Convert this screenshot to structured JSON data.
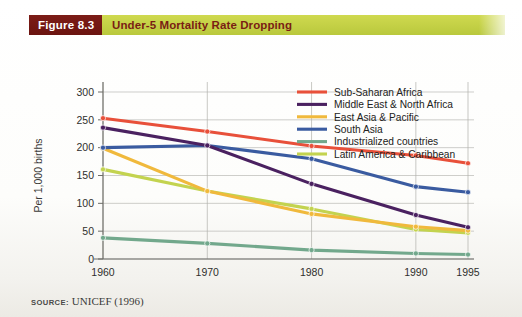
{
  "figure": {
    "tag": "Figure 8.3",
    "title": "Under-5 Mortality Rate Dropping",
    "tag_bg": "#6b1410",
    "bar_bg": "#c3d045",
    "title_color": "#7a1d14"
  },
  "source": {
    "label": "SOURCE:",
    "value": "UNICEF (1996)"
  },
  "chart_data": {
    "type": "line",
    "title": "Under-5 Mortality Rate Dropping",
    "xlabel": "",
    "ylabel": "Per 1,000 births",
    "x": [
      1960,
      1970,
      1980,
      1990,
      1995
    ],
    "xtick_labels": [
      "1960",
      "1970",
      "1980",
      "1990",
      "1995"
    ],
    "ytick_labels": [
      "0",
      "50",
      "100",
      "150",
      "200",
      "250",
      "300"
    ],
    "yticks": [
      0,
      50,
      100,
      150,
      200,
      250,
      300
    ],
    "ylim": [
      0,
      310
    ],
    "grid": true,
    "legend_position": "top-right",
    "series": [
      {
        "name": "Sub-Saharan Africa",
        "color": "#e8503a",
        "values": [
          253,
          229,
          203,
          186,
          172
        ]
      },
      {
        "name": "Middle East & North Africa",
        "color": "#4a2160",
        "values": [
          236,
          204,
          135,
          79,
          57
        ]
      },
      {
        "name": "East Asia & Pacific",
        "color": "#f0b93c",
        "values": [
          199,
          122,
          81,
          58,
          51
        ]
      },
      {
        "name": "South Asia",
        "color": "#3a5ba0",
        "values": [
          200,
          204,
          180,
          130,
          120
        ]
      },
      {
        "name": "Industrialized countries",
        "color": "#72a88c",
        "values": [
          38,
          28,
          16,
          10,
          8
        ]
      },
      {
        "name": "Latin America & Caribbean",
        "color": "#c3d34f",
        "values": [
          161,
          122,
          90,
          53,
          47
        ]
      }
    ]
  }
}
